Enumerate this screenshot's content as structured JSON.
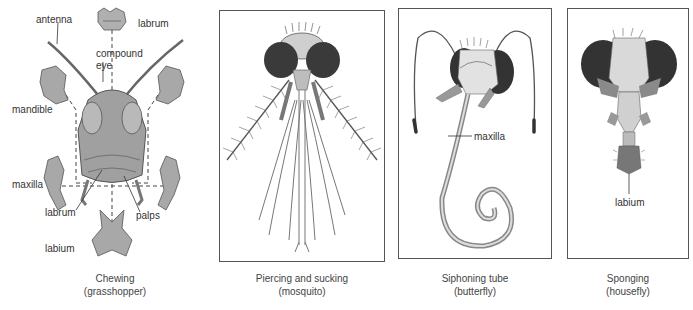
{
  "figure": {
    "panels": [
      {
        "id": "chewing",
        "caption_line1": "Chewing",
        "caption_line2": "(grasshopper)",
        "labels": {
          "antenna": "antenna",
          "labrum_top": "labrum",
          "compound_eye_1": "compound",
          "compound_eye_2": "eye",
          "mandible": "mandible",
          "maxilla": "maxilla",
          "labrum_bottom": "labrum",
          "palps": "palps",
          "labium": "labium"
        }
      },
      {
        "id": "piercing",
        "caption_line1": "Piercing and sucking",
        "caption_line2": "(mosquito)",
        "labels": {}
      },
      {
        "id": "siphoning",
        "caption_line1": "Siphoning tube",
        "caption_line2": "(butterfly)",
        "labels": {
          "maxilla": "maxilla"
        }
      },
      {
        "id": "sponging",
        "caption_line1": "Sponging",
        "caption_line2": "(housefly)",
        "labels": {
          "labium": "labium"
        }
      }
    ],
    "colors": {
      "frame": "#555555",
      "ink": "#333333",
      "body_fill": "#a9a9a9",
      "eye_fill": "#2f2f2f"
    }
  }
}
